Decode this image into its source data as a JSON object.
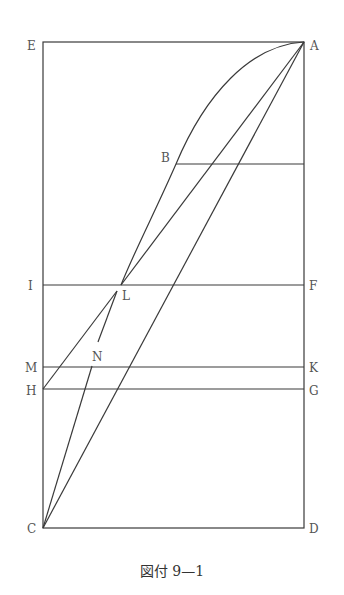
{
  "figure": {
    "caption": "図付 9—1",
    "labels": {
      "A": "A",
      "B": "B",
      "C": "C",
      "D": "D",
      "E": "E",
      "F": "F",
      "G": "G",
      "H": "H",
      "I": "I",
      "K": "K",
      "L": "L",
      "M": "M",
      "N": "N"
    },
    "points": {
      "A": [
        304,
        42
      ],
      "E": [
        43,
        42
      ],
      "C": [
        43,
        528
      ],
      "D": [
        304,
        528
      ],
      "B": [
        176,
        164
      ],
      "I": [
        43,
        285
      ],
      "F": [
        304,
        285
      ],
      "L": [
        121,
        285
      ],
      "M": [
        43,
        367
      ],
      "K": [
        304,
        367
      ],
      "H": [
        43,
        389
      ],
      "G": [
        304,
        389
      ],
      "N": [
        98,
        345
      ]
    },
    "colors": {
      "line": "#3a3a3a",
      "label": "#555555"
    }
  }
}
